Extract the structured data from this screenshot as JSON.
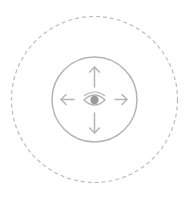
{
  "icon": {
    "name": "pan-view-control",
    "colors": {
      "stroke": "#b4b4b4",
      "outer_dash": "#bdbdbd",
      "pupil": "#9a9a9a",
      "background": "#ffffff"
    },
    "outer_ring": {
      "style": "dashed"
    },
    "inner_ring": {
      "style": "solid"
    },
    "arrows": [
      "up",
      "down",
      "left",
      "right"
    ],
    "center_glyph": "eye"
  }
}
